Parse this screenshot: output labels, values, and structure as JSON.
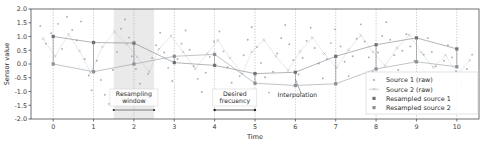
{
  "chart_data": {
    "type": "scatter",
    "title": "",
    "xlabel": "Time",
    "ylabel": "Sensor value",
    "xlim": [
      -0.55,
      10.55
    ],
    "ylim": [
      -2.0,
      2.0
    ],
    "xticks": [
      "0",
      "1",
      "2",
      "3",
      "4",
      "5",
      "6",
      "7",
      "8",
      "9",
      "10"
    ],
    "xtick_values": [
      0,
      1,
      2,
      3,
      4,
      5,
      6,
      7,
      8,
      9,
      10
    ],
    "yticks": [
      "2.0",
      "1.5",
      "1.0",
      "0.5",
      "0.0",
      "-0.5",
      "-1.0",
      "-1.5",
      "-2.0"
    ],
    "ytick_values": [
      2.0,
      1.5,
      1.0,
      0.5,
      0.0,
      -0.5,
      -1.0,
      -1.5,
      -2.0
    ],
    "grid": "vertical-dotted-at-integers",
    "legend_position": "lower-right",
    "colors": {
      "source1_raw": "#9aa3ab",
      "source2_raw": "#b0b6bb",
      "resampled1": "#6e7277",
      "resampled2": "#8b9096",
      "window_fill": "#e3e3e3",
      "grid": "#9aa3ab",
      "axis": "#4d4d4d"
    },
    "series": [
      {
        "name": "Source 1 (raw)",
        "marker": "dot",
        "points": [
          [
            -0.32,
            1.38
          ],
          [
            -0.18,
            0.74
          ],
          [
            -0.05,
            1.12
          ],
          [
            0.12,
            1.46
          ],
          [
            0.22,
            0.55
          ],
          [
            0.34,
            1.72
          ],
          [
            0.47,
            1.24
          ],
          [
            0.58,
            0.86
          ],
          [
            0.69,
            1.55
          ],
          [
            0.78,
            0.18
          ],
          [
            0.88,
            -0.42
          ],
          [
            0.95,
            -0.95
          ],
          [
            1.08,
            0.12
          ],
          [
            1.18,
            -0.58
          ],
          [
            1.28,
            -1.12
          ],
          [
            1.38,
            -1.45
          ],
          [
            1.48,
            -0.22
          ],
          [
            1.58,
            0.44
          ],
          [
            1.68,
            1.28
          ],
          [
            1.78,
            1.62
          ],
          [
            1.88,
            0.96
          ],
          [
            1.95,
            0.28
          ],
          [
            2.05,
            -0.18
          ],
          [
            2.15,
            -0.72
          ],
          [
            2.25,
            -1.08
          ],
          [
            2.35,
            -0.36
          ],
          [
            2.45,
            0.22
          ],
          [
            2.55,
            0.68
          ],
          [
            2.65,
            1.14
          ],
          [
            2.75,
            0.42
          ],
          [
            2.85,
            -0.14
          ],
          [
            2.95,
            -0.62
          ],
          [
            3.08,
            0.18
          ],
          [
            3.18,
            0.74
          ],
          [
            3.28,
            1.22
          ],
          [
            3.38,
            0.52
          ],
          [
            3.48,
            -0.08
          ],
          [
            3.58,
            -0.54
          ],
          [
            3.68,
            -1.02
          ],
          [
            3.78,
            -0.32
          ],
          [
            3.88,
            0.26
          ],
          [
            3.98,
            0.82
          ],
          [
            4.12,
            1.18
          ],
          [
            4.22,
            0.46
          ],
          [
            4.32,
            -0.12
          ],
          [
            4.42,
            -0.68
          ],
          [
            4.52,
            -1.18
          ],
          [
            4.62,
            -0.44
          ],
          [
            4.72,
            0.32
          ],
          [
            4.82,
            0.88
          ],
          [
            4.92,
            1.34
          ],
          [
            5.05,
            0.62
          ],
          [
            5.15,
            0.04
          ],
          [
            5.25,
            -0.48
          ],
          [
            5.35,
            -1.04
          ],
          [
            5.45,
            -0.28
          ],
          [
            5.55,
            0.38
          ],
          [
            5.65,
            0.94
          ],
          [
            5.75,
            1.42
          ],
          [
            5.85,
            0.72
          ],
          [
            5.95,
            0.14
          ],
          [
            6.08,
            -0.38
          ],
          [
            6.18,
            0.22
          ],
          [
            6.28,
            0.84
          ],
          [
            6.38,
            1.32
          ],
          [
            6.48,
            0.58
          ],
          [
            6.58,
            0.02
          ],
          [
            6.68,
            -0.52
          ],
          [
            6.78,
            0.18
          ],
          [
            6.88,
            0.76
          ],
          [
            6.98,
            1.26
          ],
          [
            7.12,
            0.64
          ],
          [
            7.22,
            0.08
          ],
          [
            7.32,
            -0.44
          ],
          [
            7.42,
            0.28
          ],
          [
            7.52,
            0.92
          ],
          [
            7.62,
            1.44
          ],
          [
            7.72,
            0.82
          ],
          [
            7.82,
            0.24
          ],
          [
            7.92,
            -0.28
          ],
          [
            8.05,
            0.42
          ],
          [
            8.15,
            1.02
          ],
          [
            8.25,
            1.52
          ],
          [
            8.35,
            0.88
          ],
          [
            8.45,
            0.32
          ],
          [
            8.55,
            -0.22
          ],
          [
            8.65,
            0.48
          ],
          [
            8.75,
            1.08
          ],
          [
            8.85,
            0.64
          ],
          [
            8.95,
            0.12
          ],
          [
            9.08,
            -0.34
          ],
          [
            9.18,
            0.34
          ],
          [
            9.28,
            0.94
          ],
          [
            9.38,
            0.44
          ],
          [
            9.48,
            -0.08
          ],
          [
            9.58,
            -0.58
          ],
          [
            9.68,
            0.12
          ],
          [
            9.78,
            0.68
          ],
          [
            9.88,
            0.24
          ],
          [
            9.98,
            -0.26
          ],
          [
            10.12,
            -0.72
          ],
          [
            10.25,
            -0.18
          ],
          [
            10.38,
            0.34
          ]
        ]
      },
      {
        "name": "Source 2 (raw)",
        "marker": "x",
        "points": [
          [
            -0.25,
            0.92
          ],
          [
            0.05,
            0.28
          ],
          [
            0.38,
            1.08
          ],
          [
            0.65,
            0.48
          ],
          [
            0.92,
            -0.32
          ],
          [
            1.22,
            0.62
          ],
          [
            1.52,
            1.18
          ],
          [
            1.82,
            0.72
          ],
          [
            2.08,
            0.26
          ],
          [
            2.38,
            -0.28
          ],
          [
            2.62,
            0.54
          ],
          [
            2.92,
            1.02
          ],
          [
            3.22,
            0.44
          ],
          [
            3.52,
            -0.18
          ],
          [
            3.82,
            0.38
          ],
          [
            4.08,
            0.86
          ],
          [
            4.38,
            0.22
          ],
          [
            4.68,
            -0.36
          ],
          [
            4.92,
            0.44
          ],
          [
            5.22,
            0.88
          ],
          [
            5.52,
            0.28
          ],
          [
            5.82,
            -0.24
          ],
          [
            6.12,
            0.46
          ],
          [
            6.42,
            0.96
          ],
          [
            6.72,
            0.38
          ],
          [
            7.02,
            -0.14
          ],
          [
            7.32,
            0.52
          ],
          [
            7.62,
            1.04
          ],
          [
            7.92,
            0.44
          ],
          [
            8.22,
            -0.06
          ],
          [
            8.52,
            0.58
          ],
          [
            8.82,
            1.06
          ],
          [
            9.12,
            0.42
          ],
          [
            9.42,
            -0.12
          ],
          [
            9.72,
            0.32
          ],
          [
            10.02,
            -0.38
          ],
          [
            10.32,
            0.14
          ]
        ]
      },
      {
        "name": "Resampled source 1",
        "marker": "square",
        "x": [
          0,
          1,
          2,
          3,
          4,
          5,
          6,
          7,
          8,
          9,
          10
        ],
        "values": [
          1.0,
          0.78,
          0.76,
          0.05,
          -0.05,
          -0.35,
          -0.3,
          0.28,
          0.7,
          0.95,
          0.55
        ]
      },
      {
        "name": "Resampled source 2",
        "marker": "square",
        "x": [
          0,
          1,
          2,
          3,
          4,
          5,
          6,
          7,
          8,
          9,
          10
        ],
        "values": [
          0.0,
          -0.28,
          0.0,
          0.28,
          0.35,
          -0.7,
          -0.78,
          -0.72,
          -0.18,
          0.08,
          -0.1
        ]
      }
    ],
    "annotations": [
      {
        "id": "resampling-window",
        "text_lines": [
          "Resampling",
          "window"
        ],
        "x_span": [
          1.5,
          2.5
        ],
        "type": "shaded-span-with-label"
      },
      {
        "id": "desired-frecuency",
        "text_lines": [
          "Desired",
          "frecuency"
        ],
        "x_span": [
          4.0,
          5.0
        ],
        "type": "arrow-span-with-label"
      },
      {
        "id": "interpolation",
        "text": "Interpolation",
        "x": 6.05,
        "type": "leader-line-label"
      }
    ],
    "legend_entries": [
      {
        "label": "Source 1 (raw)",
        "marker": "dot",
        "color": "#9aa3ab"
      },
      {
        "label": "Source 2 (raw)",
        "marker": "line-x",
        "color": "#b0b6bb"
      },
      {
        "label": "Resampled source 1",
        "marker": "square",
        "color": "#6e7277"
      },
      {
        "label": "Resampled source 2",
        "marker": "square",
        "color": "#8b9096"
      }
    ]
  }
}
